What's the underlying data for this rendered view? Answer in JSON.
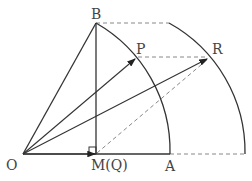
{
  "diagram": {
    "labels": {
      "B": "B",
      "P": "P",
      "R": "R",
      "O": "O",
      "M": "M(Q)",
      "A": "A"
    },
    "colors": {
      "stroke": "#333333",
      "dashed": "#888888",
      "label": "#444444"
    }
  }
}
